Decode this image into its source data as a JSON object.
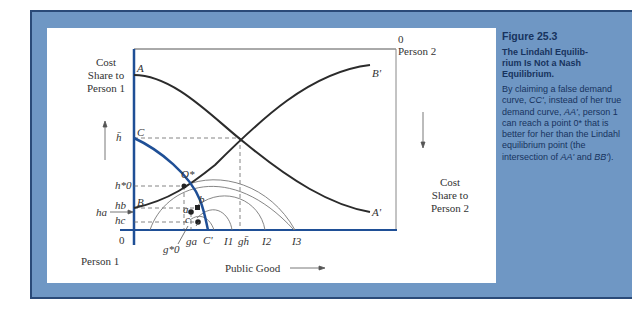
{
  "figure": {
    "number": "Figure 25.3",
    "title_lines": [
      "The Lindahl Equilib-",
      "rium Is Not a Nash",
      "Equilibrium."
    ],
    "body_parts": {
      "p1": "By claiming a false demand curve, ",
      "cc": "CC'",
      "p2": ", instead of her true demand curve, ",
      "aa": "AA'",
      "p3": ", person 1 can reach a point 0* that is better for her than the Lindahl equilibrium point (the intersection of ",
      "aa2": "AA'",
      "p4": " and ",
      "bb": "BB'",
      "p5": ")."
    }
  },
  "diagram": {
    "left_axis_label": [
      "Cost",
      "Share to",
      "Person 1"
    ],
    "right_axis_label": [
      "Cost",
      "Share to",
      "Person 2"
    ],
    "origin_person1": "0",
    "person1_label": "Person 1",
    "origin_person2": "0",
    "person2_label": "Person 2",
    "x_axis_label": "Public Good",
    "curve_labels": {
      "A": "A",
      "A_prime": "A'",
      "B": "B",
      "B_prime": "B'",
      "C": "C",
      "C_prime": "C'",
      "O_star": "O*",
      "a": "a",
      "b": "b",
      "c": "c"
    },
    "y_ticks": {
      "h_bar": "h̄",
      "h0_star": "h*0",
      "h_b": "hb",
      "h_a": "ha",
      "h_c": "hc"
    },
    "x_ticks": {
      "g0_star": "g*0",
      "g_a": "ga",
      "C_prime": "C'",
      "I1": "I1",
      "g_h": "gh̄",
      "I2": "I2",
      "I3": "I3"
    },
    "colors": {
      "axis_blue": "#1f4f96",
      "curve_dark": "#2b2b2b",
      "indiff_gray": "#777777",
      "panel_blue": "#6f97c4",
      "caption_text": "#17335e"
    }
  }
}
